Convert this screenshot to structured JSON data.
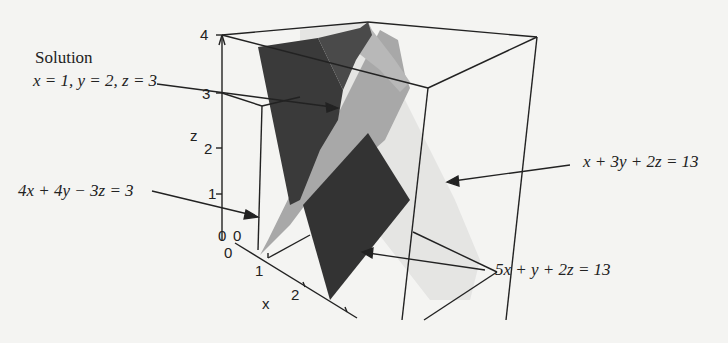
{
  "figure": {
    "type": "3d-plane-intersection",
    "solution": {
      "title": "Solution",
      "text": "x = 1, y = 2, z = 3"
    },
    "planes": [
      {
        "id": "plane-a",
        "equation": "4x + 4y − 3z = 3",
        "shade": "#9a9a9a"
      },
      {
        "id": "plane-b",
        "equation": "x + 3y + 2z = 13",
        "shade": "#dcdcdc"
      },
      {
        "id": "plane-c",
        "equation": "5x + y + 2z = 13",
        "shade": "#333333"
      }
    ],
    "axes": {
      "z": {
        "label": "z",
        "ticks": [
          "0",
          "1",
          "2",
          "3",
          "4"
        ]
      },
      "x": {
        "label": "x",
        "ticks": [
          "0",
          "1",
          "2"
        ]
      },
      "y": {
        "tick0": "0"
      }
    }
  }
}
